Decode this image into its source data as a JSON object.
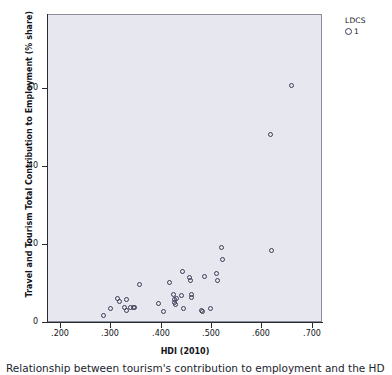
{
  "chart_data": {
    "type": "scatter",
    "title": "",
    "xlabel": "HDI (2010)",
    "ylabel": "Travel and Tourism Total Contribution to Employment (% share)",
    "xlim": [
      0.175,
      0.72
    ],
    "ylim": [
      0,
      79
    ],
    "xticks": [
      ".200",
      ".300",
      ".400",
      ".500",
      ".600",
      ".700"
    ],
    "xtick_values": [
      0.2,
      0.3,
      0.4,
      0.5,
      0.6,
      0.7
    ],
    "yticks": [
      "0",
      "20",
      "40",
      "60"
    ],
    "ytick_values": [
      0,
      20,
      40,
      60
    ],
    "grid": false,
    "legend_position": "top-right",
    "series": [
      {
        "name": "1",
        "marker": "open-circle",
        "color": "#3a3c55",
        "points": [
          {
            "x": 0.285,
            "y": 1.9
          },
          {
            "x": 0.299,
            "y": 3.6
          },
          {
            "x": 0.313,
            "y": 6.2
          },
          {
            "x": 0.317,
            "y": 5.6
          },
          {
            "x": 0.331,
            "y": 6.1
          },
          {
            "x": 0.327,
            "y": 3.9
          },
          {
            "x": 0.33,
            "y": 3.3
          },
          {
            "x": 0.339,
            "y": 4.1
          },
          {
            "x": 0.344,
            "y": 4.0
          },
          {
            "x": 0.347,
            "y": 4.0
          },
          {
            "x": 0.356,
            "y": 10.0
          },
          {
            "x": 0.394,
            "y": 5.0
          },
          {
            "x": 0.404,
            "y": 3.0
          },
          {
            "x": 0.416,
            "y": 10.5
          },
          {
            "x": 0.424,
            "y": 7.4
          },
          {
            "x": 0.425,
            "y": 5.9
          },
          {
            "x": 0.426,
            "y": 5.3
          },
          {
            "x": 0.428,
            "y": 4.8
          },
          {
            "x": 0.43,
            "y": 6.3
          },
          {
            "x": 0.441,
            "y": 13.2
          },
          {
            "x": 0.439,
            "y": 7.0
          },
          {
            "x": 0.443,
            "y": 3.8
          },
          {
            "x": 0.455,
            "y": 11.6
          },
          {
            "x": 0.457,
            "y": 11.0
          },
          {
            "x": 0.459,
            "y": 7.3
          },
          {
            "x": 0.46,
            "y": 6.6
          },
          {
            "x": 0.479,
            "y": 3.2
          },
          {
            "x": 0.482,
            "y": 2.9
          },
          {
            "x": 0.485,
            "y": 12.0
          },
          {
            "x": 0.498,
            "y": 3.6
          },
          {
            "x": 0.508,
            "y": 12.7
          },
          {
            "x": 0.51,
            "y": 10.9
          },
          {
            "x": 0.519,
            "y": 19.4
          },
          {
            "x": 0.521,
            "y": 16.3
          },
          {
            "x": 0.617,
            "y": 18.7
          },
          {
            "x": 0.615,
            "y": 48.4
          },
          {
            "x": 0.658,
            "y": 60.9
          }
        ]
      }
    ]
  },
  "legend": {
    "title": "LDCS",
    "entry_label": "1"
  },
  "axes": {
    "x_title": "HDI (2010)",
    "y_title": "Travel and Tourism Total Contribution to Employment (% share)"
  },
  "caption": {
    "text": "Relationship between tourism's contribution to employment and the HD"
  }
}
